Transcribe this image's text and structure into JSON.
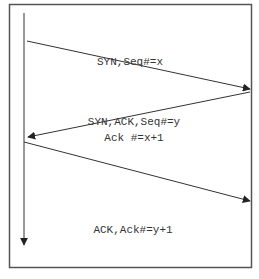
{
  "diagram": {
    "type": "sequence",
    "messages": [
      {
        "label": "SYN,Seq#=x",
        "direction": "left-to-right"
      },
      {
        "label_line1": "SYN,ACK,Seq#=y",
        "label_line2": "Ack #=x+1",
        "direction": "right-to-left"
      },
      {
        "label": "ACK,Ack#=y+1",
        "direction": "left-to-right"
      }
    ],
    "colors": {
      "line": "#333333",
      "frame": "#555555",
      "background": "#ffffff"
    }
  }
}
